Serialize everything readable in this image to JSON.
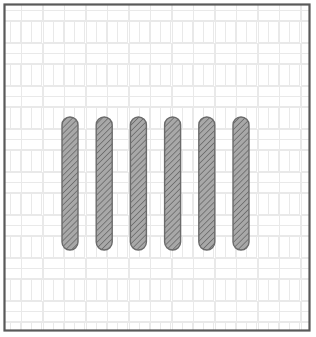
{
  "figure": {
    "canvas": {
      "width": 316,
      "height": 337,
      "background_color": "#ffffff"
    },
    "frame": {
      "label": "section-outline",
      "x": 3.5,
      "y": 3.5,
      "width": 307,
      "height": 328,
      "stroke_color": "#595959",
      "stroke_width": 2.2,
      "fill_color": "none"
    },
    "background_pattern": {
      "name": "basketweave-brick-hatch",
      "description": "Faint basketweave masonry pattern of paired bricks alternating horizontal and vertical",
      "cell_size": 43,
      "brick_thickness": 20,
      "line_color": "#e9e9e9",
      "line_width": 1,
      "fill_color": "#ffffff",
      "opacity": 1
    },
    "bars": {
      "count": 6,
      "shape": "stadium-rounded-cap",
      "label": "vertical-hatched-bar",
      "width": 16,
      "top_y": 117,
      "bottom_y": 250,
      "height": 133,
      "corner_radius": 8,
      "spacing": 34.2,
      "x_positions": [
        62,
        96.2,
        130.4,
        164.6,
        198.8,
        233
      ],
      "fill_color": "#8d8d8d",
      "stroke_color": "#6b6b6b",
      "stroke_width": 1.4,
      "hatch": {
        "name": "diagonal-45-hatch",
        "angle_degrees": 45,
        "spacing": 3,
        "line_color": "#6e6e6e",
        "line_width": 0.9,
        "base_fill": "#a8a8a8"
      },
      "items": [
        {
          "id": "bar-1",
          "index": 1,
          "x": 62
        },
        {
          "id": "bar-2",
          "index": 2,
          "x": 96.2
        },
        {
          "id": "bar-3",
          "index": 3,
          "x": 130.4
        },
        {
          "id": "bar-4",
          "index": 4,
          "x": 164.6
        },
        {
          "id": "bar-5",
          "index": 5,
          "x": 198.8
        },
        {
          "id": "bar-6",
          "index": 6,
          "x": 233
        }
      ]
    }
  }
}
